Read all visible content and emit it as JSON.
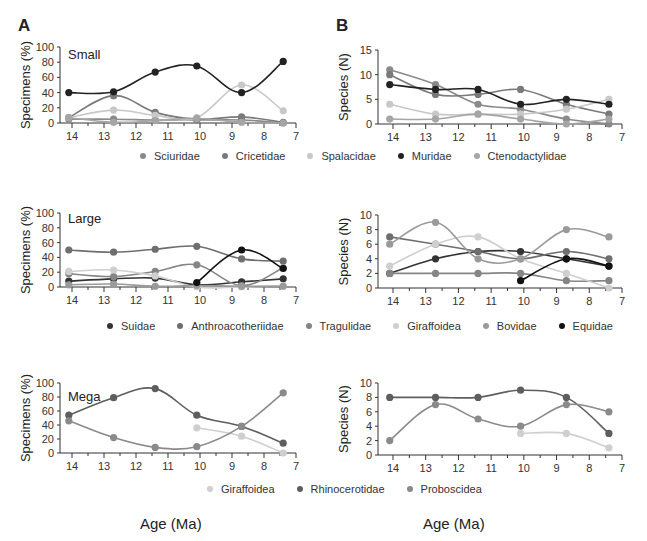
{
  "figure": {
    "panel_labels": [
      "A",
      "B"
    ],
    "xlabel": "Age (Ma)"
  },
  "chart_data": [
    {
      "id": "small-specimens",
      "type": "line",
      "panel": "A",
      "title": "Small",
      "xlabel": "Age (Ma)",
      "ylabel": "Specimens (%)",
      "xlim": [
        14.3,
        7
      ],
      "ylim": [
        0,
        100
      ],
      "xticks": [
        14,
        13,
        12,
        11,
        10,
        9,
        8,
        7
      ],
      "yticks": [
        0,
        20,
        40,
        60,
        80,
        100
      ],
      "x": [
        14.1,
        12.7,
        11.4,
        10.1,
        8.7,
        7.4
      ],
      "series": [
        {
          "name": "Sciuridae",
          "color": "#8a8a8a",
          "values": [
            5,
            5,
            4,
            4,
            4,
            0
          ]
        },
        {
          "name": "Cricetidae",
          "color": "#7a7a7a",
          "values": [
            7,
            36,
            14,
            5,
            8,
            1
          ]
        },
        {
          "name": "Spalacidae",
          "color": "#c8c8c8",
          "values": [
            7,
            17,
            10,
            7,
            50,
            16
          ]
        },
        {
          "name": "Muridae",
          "color": "#222222",
          "values": [
            40,
            41,
            67,
            75,
            40,
            81
          ]
        },
        {
          "name": "Ctenodactylidae",
          "color": "#a5a5a5",
          "values": [
            7,
            1,
            3,
            6,
            1,
            0
          ]
        }
      ]
    },
    {
      "id": "small-species",
      "type": "line",
      "panel": "B",
      "title": "",
      "xlabel": "Age (Ma)",
      "ylabel": "Species (N)",
      "xlim": [
        14.3,
        7
      ],
      "ylim": [
        0,
        15
      ],
      "xticks": [
        14,
        13,
        12,
        11,
        10,
        9,
        8,
        7
      ],
      "yticks": [
        0,
        5,
        10,
        15
      ],
      "x": [
        14.1,
        12.7,
        11.4,
        10.1,
        8.7,
        7.4
      ],
      "series": [
        {
          "name": "Sciuridae",
          "color": "#8a8a8a",
          "values": [
            11,
            8,
            4,
            3,
            1,
            0
          ]
        },
        {
          "name": "Cricetidae",
          "color": "#7a7a7a",
          "values": [
            10,
            6,
            6,
            7,
            4,
            2
          ]
        },
        {
          "name": "Spalacidae",
          "color": "#c8c8c8",
          "values": [
            4,
            2,
            2,
            2,
            3,
            5
          ]
        },
        {
          "name": "Muridae",
          "color": "#222222",
          "values": [
            8,
            7,
            7,
            4,
            5,
            4
          ]
        },
        {
          "name": "Ctenodactylidae",
          "color": "#a5a5a5",
          "values": [
            1,
            1,
            2,
            1,
            0,
            1
          ]
        }
      ]
    },
    {
      "id": "large-specimens",
      "type": "line",
      "panel": "A",
      "title": "Large",
      "xlabel": "Age (Ma)",
      "ylabel": "Specimens (%)",
      "xlim": [
        14.3,
        7
      ],
      "ylim": [
        0,
        100
      ],
      "xticks": [
        14,
        13,
        12,
        11,
        10,
        9,
        8,
        7
      ],
      "yticks": [
        0,
        20,
        40,
        60,
        80,
        100
      ],
      "x": [
        14.1,
        12.7,
        11.4,
        10.1,
        8.7,
        7.4
      ],
      "series": [
        {
          "name": "Suidae",
          "color": "#333333",
          "values": [
            8,
            11,
            12,
            3,
            7,
            11
          ]
        },
        {
          "name": "Anthroacotheriidae",
          "color": "#6e6e6e",
          "values": [
            50,
            47,
            51,
            55,
            38,
            35
          ]
        },
        {
          "name": "Tragulidae",
          "color": "#858585",
          "values": [
            18,
            14,
            21,
            30,
            2,
            26
          ]
        },
        {
          "name": "Giraffoidea",
          "color": "#cfcfcf",
          "values": [
            21,
            23,
            15,
            0,
            0,
            2
          ]
        },
        {
          "name": "Bovidae",
          "color": "#9a9a9a",
          "values": [
            3,
            4,
            1,
            2,
            1,
            1
          ]
        },
        {
          "name": "Equidae",
          "color": "#111111",
          "values": [
            null,
            null,
            null,
            6,
            50,
            25
          ]
        }
      ]
    },
    {
      "id": "large-species",
      "type": "line",
      "panel": "B",
      "title": "",
      "xlabel": "Age (Ma)",
      "ylabel": "Species (N)",
      "xlim": [
        14.3,
        7
      ],
      "ylim": [
        0,
        10
      ],
      "xticks": [
        14,
        13,
        12,
        11,
        10,
        9,
        8,
        7
      ],
      "yticks": [
        0,
        2,
        4,
        6,
        8,
        10
      ],
      "x": [
        14.1,
        12.7,
        11.4,
        10.1,
        8.7,
        7.4
      ],
      "series": [
        {
          "name": "Suidae",
          "color": "#333333",
          "values": [
            2,
            4,
            5,
            5,
            4,
            3
          ]
        },
        {
          "name": "Anthroacotheriidae",
          "color": "#6e6e6e",
          "values": [
            7,
            6,
            5,
            4,
            5,
            4
          ]
        },
        {
          "name": "Tragulidae",
          "color": "#858585",
          "values": [
            2,
            2,
            2,
            2,
            1,
            1
          ]
        },
        {
          "name": "Giraffoidea",
          "color": "#cfcfcf",
          "values": [
            3,
            6,
            7,
            4,
            2,
            0
          ]
        },
        {
          "name": "Bovidae",
          "color": "#9a9a9a",
          "values": [
            6,
            9,
            4,
            4,
            8,
            7
          ]
        },
        {
          "name": "Equidae",
          "color": "#111111",
          "values": [
            null,
            null,
            null,
            1,
            4,
            3
          ]
        }
      ]
    },
    {
      "id": "mega-specimens",
      "type": "line",
      "panel": "A",
      "title": "Mega",
      "xlabel": "Age (Ma)",
      "ylabel": "Specimens (%)",
      "xlim": [
        14.3,
        7
      ],
      "ylim": [
        0,
        100
      ],
      "xticks": [
        14,
        13,
        12,
        11,
        10,
        9,
        8,
        7
      ],
      "yticks": [
        0,
        20,
        40,
        60,
        80,
        100
      ],
      "x": [
        14.1,
        12.7,
        11.4,
        10.1,
        8.7,
        7.4
      ],
      "series": [
        {
          "name": "Giraffoidea",
          "color": "#cfcfcf",
          "values": [
            null,
            null,
            null,
            36,
            24,
            0
          ]
        },
        {
          "name": "Rhinocerotidae",
          "color": "#5e5e5e",
          "values": [
            54,
            79,
            92,
            54,
            38,
            14
          ]
        },
        {
          "name": "Proboscidea",
          "color": "#8a8a8a",
          "values": [
            46,
            22,
            8,
            9,
            38,
            86
          ]
        }
      ]
    },
    {
      "id": "mega-species",
      "type": "line",
      "panel": "B",
      "title": "",
      "xlabel": "Age (Ma)",
      "ylabel": "Species (N)",
      "xlim": [
        14.3,
        7
      ],
      "ylim": [
        0,
        10
      ],
      "xticks": [
        14,
        13,
        12,
        11,
        10,
        9,
        8,
        7
      ],
      "yticks": [
        0,
        2,
        4,
        6,
        8,
        10
      ],
      "x": [
        14.1,
        12.7,
        11.4,
        10.1,
        8.7,
        7.4
      ],
      "series": [
        {
          "name": "Giraffoidea",
          "color": "#cfcfcf",
          "values": [
            null,
            null,
            null,
            3,
            3,
            1
          ]
        },
        {
          "name": "Rhinocerotidae",
          "color": "#5e5e5e",
          "values": [
            8,
            8,
            8,
            9,
            8,
            3
          ]
        },
        {
          "name": "Proboscidea",
          "color": "#8a8a8a",
          "values": [
            2,
            7,
            5,
            4,
            7,
            6
          ]
        }
      ]
    }
  ],
  "legends": {
    "small": [
      "Sciuridae",
      "Cricetidae",
      "Spalacidae",
      "Muridae",
      "Ctenodactylidae"
    ],
    "large": [
      "Suidae",
      "Anthroacotheriidae",
      "Tragulidae",
      "Giraffoidea",
      "Bovidae",
      "Equidae"
    ],
    "mega": [
      "Giraffoidea",
      "Rhinocerotidae",
      "Proboscidea"
    ]
  }
}
